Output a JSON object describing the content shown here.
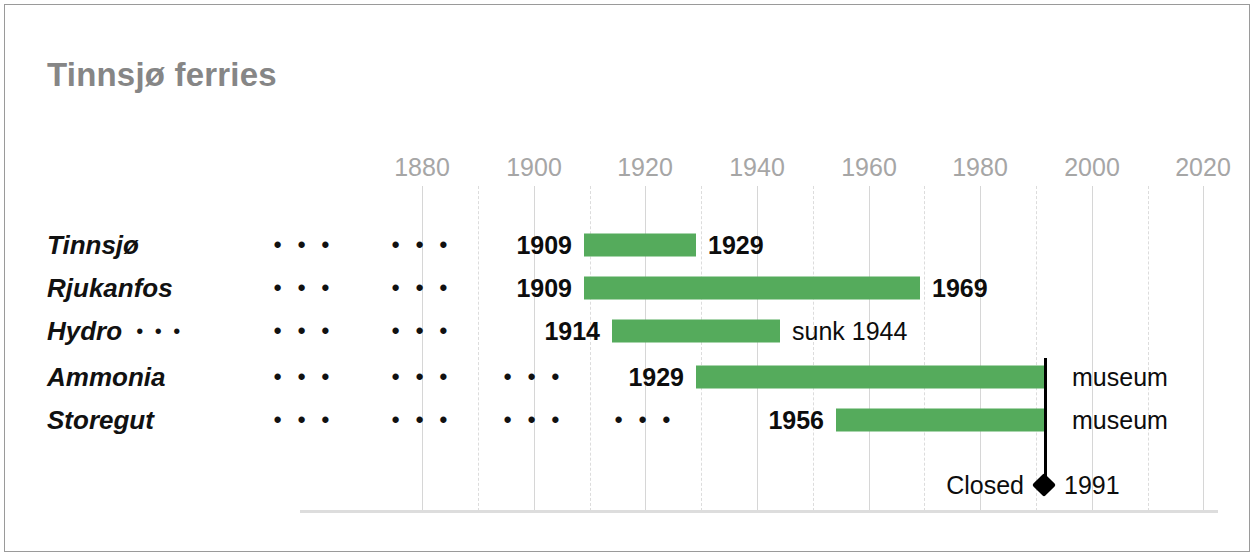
{
  "chart_data": {
    "type": "bar",
    "title": "Tinnsjø ferries",
    "xlabel": "",
    "ylabel": "",
    "orientation": "horizontal-timeline",
    "xlim": [
      1870,
      2025
    ],
    "grid": true,
    "major_tick_step": 20,
    "minor_tick_step": 10,
    "legend": "none",
    "xticks": [
      1880,
      1900,
      1920,
      1940,
      1960,
      1980,
      2000,
      2020
    ],
    "xtick_labels": [
      "1880",
      "1900",
      "1920",
      "1940",
      "1960",
      "1980",
      "2000",
      "2020"
    ],
    "minor_gridlines": [
      1890,
      1910,
      1930,
      1950,
      1970,
      1990,
      2010
    ],
    "categories": [
      "Tinnsjø",
      "Rjukanfos",
      "Hydro",
      "Ammonia",
      "Storegut"
    ],
    "series": [
      {
        "name": "service period",
        "bars": [
          {
            "category": "Tinnsjø",
            "start": 1909,
            "end": 1929
          },
          {
            "category": "Rjukanfos",
            "start": 1909,
            "end": 1969
          },
          {
            "category": "Hydro",
            "start": 1914,
            "end": 1944
          },
          {
            "category": "Ammonia",
            "start": 1929,
            "end": 1991
          },
          {
            "category": "Storegut",
            "start": 1956,
            "end": 1991
          }
        ]
      }
    ],
    "annotations": [
      {
        "text": "1909",
        "year": 1909,
        "row": "Tinnsjø",
        "align": "right",
        "bold": true
      },
      {
        "text": "1929",
        "year": 1929,
        "row": "Tinnsjø",
        "align": "left",
        "bold": true
      },
      {
        "text": "1909",
        "year": 1909,
        "row": "Rjukanfos",
        "align": "right",
        "bold": true
      },
      {
        "text": "1969",
        "year": 1969,
        "row": "Rjukanfos",
        "align": "left",
        "bold": true
      },
      {
        "text": "1914",
        "year": 1914,
        "row": "Hydro",
        "align": "right",
        "bold": true
      },
      {
        "text": "sunk 1944",
        "year": 1944,
        "row": "Hydro",
        "align": "left",
        "bold": false
      },
      {
        "text": "1929",
        "year": 1929,
        "row": "Ammonia",
        "align": "right",
        "bold": true
      },
      {
        "text": "museum",
        "year": 1991,
        "row": "Ammonia",
        "align": "left",
        "bold": false
      },
      {
        "text": "1956",
        "year": 1956,
        "row": "Storegut",
        "align": "right",
        "bold": true
      },
      {
        "text": "museum",
        "year": 1991,
        "row": "Storegut",
        "align": "left",
        "bold": false
      },
      {
        "text": "Closed",
        "year": 1991,
        "row": "closed",
        "align": "right",
        "bold": false
      },
      {
        "text": "1991",
        "year": 1991,
        "row": "closed",
        "align": "left",
        "bold": false
      }
    ],
    "marker": {
      "label": "Closed",
      "year": 1991,
      "value_label": "1991",
      "shape": "diamond",
      "color": "#000000"
    },
    "bar_color": "#55ab5c",
    "gridline_color": "#d6d6d6",
    "axis_label_color": "#a6a6a6"
  },
  "title": "Tinnsjø ferries",
  "axis": {
    "ticks": [
      {
        "label": "1880",
        "x": 422
      },
      {
        "label": "1900",
        "x": 534
      },
      {
        "label": "1920",
        "x": 645
      },
      {
        "label": "1940",
        "x": 757
      },
      {
        "label": "1960",
        "x": 869
      },
      {
        "label": "1980",
        "x": 980
      },
      {
        "label": "2000",
        "x": 1092
      },
      {
        "label": "2020",
        "x": 1203
      }
    ],
    "minor_x": [
      478,
      590,
      701,
      813,
      924,
      1036,
      1148
    ]
  },
  "rows": [
    {
      "name": "Tinnsjø",
      "label": "Tinnsjø",
      "trailing_dots": "",
      "y": 245,
      "dots": [
        304,
        422
      ],
      "bar": {
        "x": 584,
        "w": 112
      },
      "start_label": {
        "text": "1909",
        "x": 572,
        "bold": true
      },
      "end_label": {
        "text": "1929",
        "x": 708,
        "bold": true
      }
    },
    {
      "name": "Rjukanfos",
      "label": "Rjukanfos",
      "trailing_dots": "",
      "y": 288,
      "dots": [
        304,
        422
      ],
      "bar": {
        "x": 584,
        "w": 336
      },
      "start_label": {
        "text": "1909",
        "x": 572,
        "bold": true
      },
      "end_label": {
        "text": "1969",
        "x": 932,
        "bold": true
      }
    },
    {
      "name": "Hydro",
      "label": "Hydro",
      "trailing_dots": "...",
      "y": 331,
      "dots": [
        304,
        422
      ],
      "bar": {
        "x": 612,
        "w": 168
      },
      "start_label": {
        "text": "1914",
        "x": 600,
        "bold": true
      },
      "end_label": {
        "text": "sunk 1944",
        "x": 792,
        "bold": false
      }
    },
    {
      "name": "Ammonia",
      "label": "Ammonia",
      "trailing_dots": "",
      "y": 377,
      "dots": [
        304,
        422,
        534
      ],
      "bar": {
        "x": 696,
        "w": 348
      },
      "start_label": {
        "text": "1929",
        "x": 684,
        "bold": true
      },
      "end_label": {
        "text": "museum",
        "x": 1072,
        "bold": false
      }
    },
    {
      "name": "Storegut",
      "label": "Storegut",
      "trailing_dots": "",
      "y": 420,
      "dots": [
        304,
        422,
        534,
        645
      ],
      "bar": {
        "x": 836,
        "w": 208
      },
      "start_label": {
        "text": "1956",
        "x": 824,
        "bold": true
      },
      "end_label": {
        "text": "museum",
        "x": 1072,
        "bold": false
      }
    }
  ],
  "closed": {
    "label": "Closed",
    "year": "1991",
    "x": 1044,
    "y": 485,
    "line_top": 358,
    "line_bottom": 485
  },
  "ellipsis_glyph": "• • •"
}
